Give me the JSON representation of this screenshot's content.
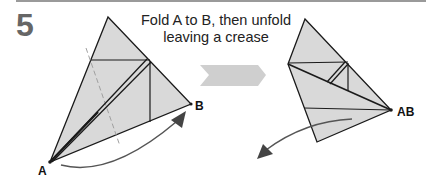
{
  "step": {
    "number": "5",
    "instruction_line1": "Fold A to B, then unfold",
    "instruction_line2": "leaving a crease"
  },
  "labels": {
    "point_a": "A",
    "point_b": "B",
    "point_ab": "AB"
  },
  "colors": {
    "paper_fill": "#d9d9d9",
    "line": "#1a1a1a",
    "step_number": "#666666",
    "transition_arrow": "#cfcfcf",
    "rule": "#9a9a9a",
    "dashed_guide": "#a0a0a0",
    "motion_arrow": "#555555"
  },
  "icons": {
    "transition": "chevron-right-arrow",
    "fold_motion_left": "curved-arrow-up-right",
    "unfold_motion_right": "curved-arrow-down-left"
  }
}
